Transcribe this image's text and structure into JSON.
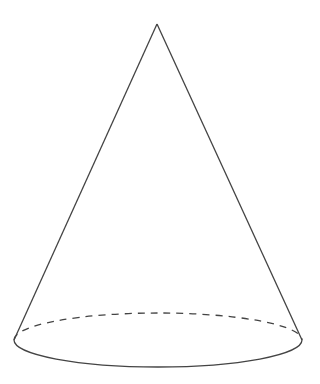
{
  "figure": {
    "stroke_color": "#444444",
    "background": "#ffffff",
    "apex": [
      157,
      24
    ],
    "base_center": [
      158,
      340
    ],
    "base_rx": 144,
    "base_ry": 27
  }
}
